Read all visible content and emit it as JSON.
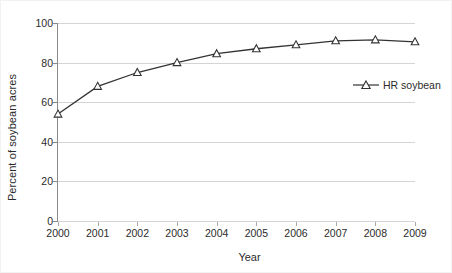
{
  "chart_data": {
    "type": "line",
    "title": "",
    "xlabel": "Year",
    "ylabel": "Percent of soybean acres",
    "categories": [
      "2000",
      "2001",
      "2002",
      "2003",
      "2004",
      "2005",
      "2006",
      "2007",
      "2008",
      "2009"
    ],
    "x": [
      2000,
      2001,
      2002,
      2003,
      2004,
      2005,
      2006,
      2007,
      2008,
      2009
    ],
    "series": [
      {
        "name": "HR soybean",
        "values": [
          54,
          68,
          75,
          80,
          84.5,
          87,
          89,
          91,
          91.5,
          90.5
        ],
        "marker": "triangle-open",
        "color": "#333333"
      }
    ],
    "ylim": [
      0,
      100
    ],
    "yticks": [
      0,
      20,
      40,
      60,
      80,
      100
    ],
    "ytick_labels": [
      "0",
      "20",
      "40",
      "60",
      "80",
      "100"
    ],
    "xlim": [
      2000,
      2009
    ],
    "grid": "horizontal",
    "legend_position": "inside-upper-right",
    "legend_entries": [
      "HR soybean"
    ]
  },
  "colors": {
    "background": "#ffffff",
    "gridline": "#d4d4d4",
    "axis": "#8a8a8a",
    "series": "#333333",
    "marker_fill": "#ffffff",
    "text": "#2b2b2b",
    "border": "#f2f2f2"
  }
}
